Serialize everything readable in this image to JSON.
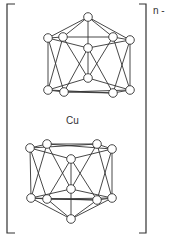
{
  "diagram": {
    "charge_label": "n -",
    "center_label": "Cu",
    "colors": {
      "line": "#333333",
      "node_fill": "#ffffff",
      "background": "#ffffff"
    },
    "node_radius": 4.3,
    "clusters": [
      {
        "name": "upper-cage",
        "nodes": [
          [
            88,
            17
          ],
          [
            48,
            38
          ],
          [
            63,
            37
          ],
          [
            113,
            37
          ],
          [
            130,
            40
          ],
          [
            88,
            48
          ],
          [
            88,
            78
          ],
          [
            48,
            90
          ],
          [
            64,
            92
          ],
          [
            113,
            93
          ],
          [
            130,
            90
          ]
        ],
        "edges": [
          [
            0,
            1
          ],
          [
            0,
            2
          ],
          [
            0,
            3
          ],
          [
            0,
            4
          ],
          [
            0,
            5
          ],
          [
            1,
            2
          ],
          [
            2,
            3
          ],
          [
            3,
            4
          ],
          [
            1,
            5
          ],
          [
            5,
            4
          ],
          [
            1,
            7
          ],
          [
            4,
            10
          ],
          [
            1,
            8
          ],
          [
            2,
            7
          ],
          [
            3,
            10
          ],
          [
            4,
            9
          ],
          [
            2,
            6
          ],
          [
            3,
            6
          ],
          [
            5,
            8
          ],
          [
            5,
            9
          ],
          [
            5,
            6
          ],
          [
            6,
            7
          ],
          [
            6,
            10
          ],
          [
            7,
            8
          ],
          [
            8,
            9
          ],
          [
            9,
            10
          ],
          [
            7,
            9
          ],
          [
            8,
            10
          ]
        ]
      },
      {
        "name": "lower-cage",
        "nodes": [
          [
            30,
            148
          ],
          [
            47,
            144
          ],
          [
            97,
            144
          ],
          [
            112,
            149
          ],
          [
            71,
            159
          ],
          [
            71,
            189
          ],
          [
            31,
            198
          ],
          [
            47,
            199
          ],
          [
            97,
            200
          ],
          [
            112,
            198
          ],
          [
            71,
            219
          ]
        ],
        "edges": [
          [
            0,
            1
          ],
          [
            1,
            2
          ],
          [
            2,
            3
          ],
          [
            0,
            4
          ],
          [
            4,
            3
          ],
          [
            0,
            2
          ],
          [
            1,
            3
          ],
          [
            0,
            6
          ],
          [
            3,
            9
          ],
          [
            0,
            7
          ],
          [
            1,
            6
          ],
          [
            2,
            9
          ],
          [
            3,
            8
          ],
          [
            1,
            5
          ],
          [
            2,
            5
          ],
          [
            4,
            7
          ],
          [
            4,
            8
          ],
          [
            4,
            5
          ],
          [
            5,
            6
          ],
          [
            5,
            9
          ],
          [
            6,
            7
          ],
          [
            7,
            8
          ],
          [
            8,
            9
          ],
          [
            6,
            8
          ],
          [
            7,
            9
          ],
          [
            6,
            10
          ],
          [
            7,
            10
          ],
          [
            8,
            10
          ],
          [
            9,
            10
          ],
          [
            5,
            10
          ]
        ]
      }
    ],
    "brackets": {
      "left": {
        "x": 7,
        "top": 4,
        "bottom": 233,
        "tick": 8
      },
      "right": {
        "x": 146,
        "top": 4,
        "bottom": 233,
        "tick": 7
      }
    }
  }
}
